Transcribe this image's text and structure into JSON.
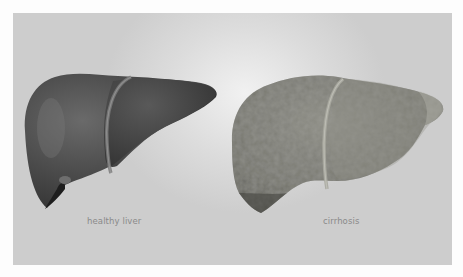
{
  "figure": {
    "type": "medical-illustration",
    "background_color": "#d6d6d6",
    "items": [
      {
        "label": "healthy liver",
        "appearance": "smooth, dark gray surface",
        "color": "#4a4a4a"
      },
      {
        "label": "cirrhosis",
        "appearance": "nodular, bumpy, lighter textured surface",
        "color": "#7a7a72"
      }
    ]
  }
}
